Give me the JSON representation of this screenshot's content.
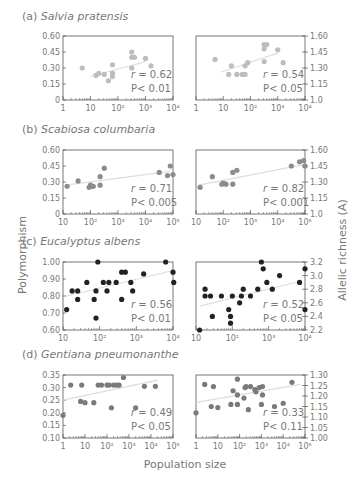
{
  "figure": {
    "ylabel_left": "Polymorphism",
    "ylabel_right": "Allelic richness (A)",
    "xlabel": "Population size"
  },
  "chart_data": [
    {
      "type": "scatter",
      "panel": "a",
      "label": "(a)",
      "title": "Salvia pratensis",
      "left": {
        "ylabel": "Polymorphism",
        "yticks": [
          "0",
          "0.15",
          "0.30",
          "0.45",
          "0.60"
        ],
        "ylim": [
          0,
          0.6
        ],
        "xticks": [
          "1",
          "10",
          "10²",
          "10³",
          "10⁴"
        ],
        "xlim_log10": [
          0,
          4
        ],
        "points": [
          [
            0.7,
            0.3
          ],
          [
            1.2,
            0.23
          ],
          [
            1.3,
            0.25
          ],
          [
            1.5,
            0.24
          ],
          [
            1.65,
            0.18
          ],
          [
            1.8,
            0.33
          ],
          [
            1.8,
            0.25
          ],
          [
            1.8,
            0.22
          ],
          [
            2.5,
            0.45
          ],
          [
            2.5,
            0.4
          ],
          [
            2.6,
            0.4
          ],
          [
            2.5,
            0.3
          ],
          [
            3.0,
            0.39
          ],
          [
            3.2,
            0.32
          ]
        ],
        "fit": [
          [
            1.0,
            0.22
          ],
          [
            3.0,
            0.36
          ]
        ],
        "r": "r = 0.62",
        "p": "P< 0.01"
      },
      "right": {
        "ylabel": "Allelic richness (A)",
        "yticks": [
          "1.0",
          "1.15",
          "1.30",
          "1.45",
          "1.60"
        ],
        "ylim": [
          1.0,
          1.6
        ],
        "xticks": [
          "1",
          "10",
          "10²",
          "10³",
          "10⁴"
        ],
        "xlim_log10": [
          0,
          4
        ],
        "points": [
          [
            0.7,
            1.38
          ],
          [
            1.2,
            1.24
          ],
          [
            1.3,
            1.32
          ],
          [
            1.5,
            1.24
          ],
          [
            1.7,
            1.24
          ],
          [
            1.8,
            1.24
          ],
          [
            1.8,
            1.32
          ],
          [
            1.9,
            1.35
          ],
          [
            2.5,
            1.52
          ],
          [
            2.6,
            1.52
          ],
          [
            2.5,
            1.48
          ],
          [
            2.5,
            1.36
          ],
          [
            3.0,
            1.47
          ],
          [
            3.2,
            1.35
          ]
        ],
        "fit": [
          [
            0.9,
            1.26
          ],
          [
            3.0,
            1.44
          ]
        ],
        "r": "r = 0.54",
        "p": "P< 0.05"
      }
    },
    {
      "type": "scatter",
      "panel": "b",
      "label": "(b)",
      "title": "Scabiosa columbaria",
      "left": {
        "yticks": [
          "0",
          "0.15",
          "0.30",
          "0.45",
          "0.60"
        ],
        "ylim": [
          0,
          0.6
        ],
        "xticks": [
          "10",
          "10²",
          "10³",
          "10⁴",
          "10⁵"
        ],
        "xlim_log10": [
          1,
          5
        ],
        "points": [
          [
            1.15,
            0.26
          ],
          [
            1.55,
            0.31
          ],
          [
            1.95,
            0.25
          ],
          [
            2.0,
            0.27
          ],
          [
            2.05,
            0.26
          ],
          [
            2.1,
            0.26
          ],
          [
            2.35,
            0.35
          ],
          [
            2.35,
            0.27
          ],
          [
            2.5,
            0.43
          ],
          [
            4.5,
            0.39
          ],
          [
            4.8,
            0.36
          ],
          [
            4.9,
            0.45
          ],
          [
            5.0,
            0.37
          ]
        ],
        "fit": [
          [
            1.1,
            0.27
          ],
          [
            4.9,
            0.4
          ]
        ],
        "r": "r = 0.71",
        "p": "P< 0.005"
      },
      "right": {
        "yticks": [
          "1.0",
          "1.15",
          "1.30",
          "1.45",
          "1.60"
        ],
        "ylim": [
          1.0,
          1.6
        ],
        "xticks": [
          "10",
          "10²",
          "10³",
          "10⁴",
          "10⁵"
        ],
        "xlim_log10": [
          1,
          5
        ],
        "points": [
          [
            1.15,
            1.25
          ],
          [
            1.6,
            1.35
          ],
          [
            1.95,
            1.28
          ],
          [
            2.0,
            1.29
          ],
          [
            2.1,
            1.28
          ],
          [
            2.35,
            1.39
          ],
          [
            2.35,
            1.28
          ],
          [
            2.5,
            1.41
          ],
          [
            4.5,
            1.45
          ],
          [
            4.8,
            1.49
          ],
          [
            4.95,
            1.5
          ],
          [
            5.0,
            1.45
          ]
        ],
        "fit": [
          [
            1.1,
            1.27
          ],
          [
            4.9,
            1.46
          ]
        ],
        "r": "r = 0.82",
        "p": "P< 0.001"
      }
    },
    {
      "type": "scatter",
      "panel": "c",
      "label": "(c)",
      "title": "Eucalyptus albens",
      "left": {
        "yticks": [
          "0.60",
          "0.70",
          "0.80",
          "0.90",
          "1.00"
        ],
        "ylim": [
          0.6,
          1.0
        ],
        "xticks": [
          "10",
          "10²",
          "10³",
          "10⁴"
        ],
        "xlim_log10": [
          1,
          4
        ],
        "points": [
          [
            1.1,
            0.72
          ],
          [
            1.25,
            0.83
          ],
          [
            1.4,
            0.83
          ],
          [
            1.4,
            0.78
          ],
          [
            1.65,
            0.88
          ],
          [
            1.85,
            0.78
          ],
          [
            1.9,
            0.67
          ],
          [
            1.9,
            0.83
          ],
          [
            1.95,
            1.0
          ],
          [
            2.1,
            0.88
          ],
          [
            2.2,
            0.83
          ],
          [
            2.25,
            0.88
          ],
          [
            2.45,
            0.88
          ],
          [
            2.6,
            0.94
          ],
          [
            2.6,
            0.78
          ],
          [
            2.7,
            0.94
          ],
          [
            2.85,
            0.88
          ],
          [
            2.9,
            0.83
          ],
          [
            3.2,
            0.93
          ],
          [
            3.8,
            1.0
          ],
          [
            4.0,
            0.94
          ],
          [
            4.02,
            0.88
          ]
        ],
        "fit": [
          [
            1.1,
            0.8
          ],
          [
            4.0,
            0.95
          ]
        ],
        "r": "r = 0.56",
        "p": "P< 0.01"
      },
      "right": {
        "yticks": [
          "2.2",
          "2.4",
          "2.6",
          "2.8",
          "3.0",
          "3.2"
        ],
        "ylim": [
          2.2,
          3.2
        ],
        "xticks": [
          "10",
          "10²",
          "10³",
          "10⁴"
        ],
        "xlim_log10": [
          1,
          4
        ],
        "points": [
          [
            1.1,
            2.2
          ],
          [
            1.25,
            2.8
          ],
          [
            1.25,
            2.7
          ],
          [
            1.4,
            2.7
          ],
          [
            1.45,
            2.4
          ],
          [
            1.7,
            2.7
          ],
          [
            1.9,
            2.5
          ],
          [
            1.95,
            2.3
          ],
          [
            1.95,
            2.4
          ],
          [
            2.0,
            2.7
          ],
          [
            2.2,
            2.6
          ],
          [
            2.25,
            2.7
          ],
          [
            2.3,
            2.8
          ],
          [
            2.5,
            2.7
          ],
          [
            2.7,
            2.8
          ],
          [
            2.8,
            3.2
          ],
          [
            2.85,
            3.1
          ],
          [
            2.95,
            2.9
          ],
          [
            3.1,
            2.8
          ],
          [
            3.3,
            3.0
          ],
          [
            3.85,
            2.9
          ],
          [
            4.0,
            3.1
          ],
          [
            4.0,
            2.5
          ]
        ],
        "fit": [
          [
            1.1,
            2.55
          ],
          [
            3.9,
            2.92
          ]
        ],
        "r": "r = 0.52",
        "p": "P< 0.05"
      }
    },
    {
      "type": "scatter",
      "panel": "d",
      "label": "(d)",
      "title": "Gentiana pneumonanthe",
      "left": {
        "yticks": [
          "0.10",
          "0.15",
          "0.20",
          "0.25",
          "0.30",
          "0.35"
        ],
        "ylim": [
          0.1,
          0.35
        ],
        "xticks": [
          "1",
          "10",
          "10²",
          "10³",
          "10⁴",
          "10⁵"
        ],
        "xlim_log10": [
          0,
          5
        ],
        "points": [
          [
            0.0,
            0.19
          ],
          [
            0.35,
            0.31
          ],
          [
            0.8,
            0.245
          ],
          [
            0.85,
            0.31
          ],
          [
            1.0,
            0.24
          ],
          [
            1.4,
            0.24
          ],
          [
            1.6,
            0.31
          ],
          [
            1.75,
            0.31
          ],
          [
            2.0,
            0.31
          ],
          [
            2.1,
            0.31
          ],
          [
            2.2,
            0.22
          ],
          [
            2.3,
            0.31
          ],
          [
            2.45,
            0.31
          ],
          [
            2.55,
            0.31
          ],
          [
            2.75,
            0.34
          ],
          [
            3.3,
            0.22
          ],
          [
            3.7,
            0.305
          ],
          [
            4.2,
            0.305
          ]
        ],
        "fit": [
          [
            0.0,
            0.25
          ],
          [
            4.3,
            0.33
          ]
        ],
        "r": "r = 0.49",
        "p": "P< 0.05"
      },
      "right": {
        "yticks": [
          "1.00",
          "1.05",
          "1.10",
          "1.15",
          "1.20",
          "1.25",
          "1.30"
        ],
        "ylim": [
          1.0,
          1.3
        ],
        "xticks": [
          "1",
          "10",
          "10²",
          "10³",
          "10⁴",
          "10⁵"
        ],
        "xlim_log10": [
          0,
          5
        ],
        "points": [
          [
            0.0,
            1.12
          ],
          [
            0.4,
            1.255
          ],
          [
            0.7,
            1.15
          ],
          [
            0.8,
            1.245
          ],
          [
            1.0,
            1.145
          ],
          [
            1.6,
            1.16
          ],
          [
            1.7,
            1.225
          ],
          [
            1.9,
            1.205
          ],
          [
            1.9,
            1.16
          ],
          [
            1.9,
            1.28
          ],
          [
            2.2,
            1.19
          ],
          [
            2.25,
            1.24
          ],
          [
            2.3,
            1.245
          ],
          [
            2.4,
            1.135
          ],
          [
            2.5,
            1.245
          ],
          [
            2.7,
            1.23
          ],
          [
            2.75,
            1.22
          ],
          [
            2.9,
            1.24
          ],
          [
            3.0,
            1.16
          ],
          [
            3.05,
            1.245
          ],
          [
            3.05,
            1.205
          ],
          [
            3.6,
            1.15
          ],
          [
            4.0,
            1.165
          ],
          [
            4.4,
            1.265
          ]
        ],
        "fit": [
          [
            0.0,
            1.17
          ],
          [
            4.8,
            1.255
          ]
        ],
        "r": "r = 0.33",
        "p": "P< 0.11"
      }
    }
  ]
}
